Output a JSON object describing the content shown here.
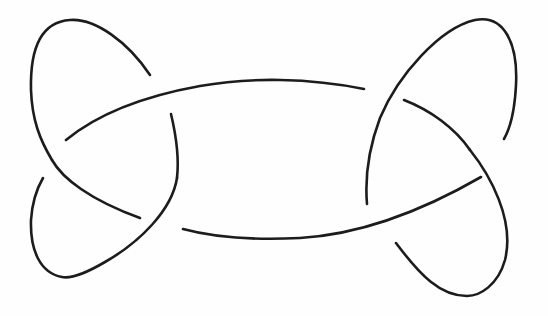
{
  "figure": {
    "type": "knot-diagram",
    "stroke_color": "#1c1c1c",
    "background_color": "#fefefe",
    "crossing_count": 6,
    "strands": [
      {
        "name": "top-left-loop",
        "d": "M150,75 C128,42 95,18 70,20 C40,22 30,50 31,90 C32,120 40,140 52,160"
      },
      {
        "name": "top-arc",
        "d": "M66,140 C100,112 150,95 200,86 C250,77 310,78 364,89"
      },
      {
        "name": "left-inner-vertical",
        "d": "M171,114 C176,135 179,160 177,178"
      },
      {
        "name": "left-lower-descent",
        "d": "M52,160 C62,178 90,200 140,218"
      },
      {
        "name": "bottom-left-loop",
        "d": "M177,178 C172,210 140,242 105,262 C88,272 72,279 62,277 C40,273 30,250 31,220 C32,205 36,190 43,178"
      },
      {
        "name": "bottom-arc",
        "d": "M183,229 C220,239 260,240 300,238 C350,235 410,218 481,177"
      },
      {
        "name": "right-upper-loop",
        "d": "M367,204 C365,180 368,150 380,118 C398,75 440,28 475,20 C505,14 518,45 516,85 C515,105 512,125 504,139"
      },
      {
        "name": "right-inner-descent",
        "d": "M404,100 C430,110 455,128 470,150"
      },
      {
        "name": "bottom-right-loop",
        "d": "M470,150 C490,175 515,220 505,260 C498,285 480,296 467,296 C440,296 420,275 396,243"
      }
    ]
  }
}
